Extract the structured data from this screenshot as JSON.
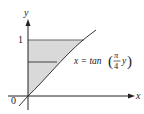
{
  "diagram": {
    "type": "region-under-curve",
    "axes": {
      "x_label": "x",
      "y_label": "y",
      "origin_label": "0",
      "y_tick_label": "1"
    },
    "curve": {
      "equation_lhs": "x = tan",
      "equation_frac_num": "π",
      "equation_frac_den": "4",
      "equation_var": "y"
    },
    "colors": {
      "shade": "#d9d9d9",
      "line": "#333333",
      "axis": "#222222"
    }
  }
}
